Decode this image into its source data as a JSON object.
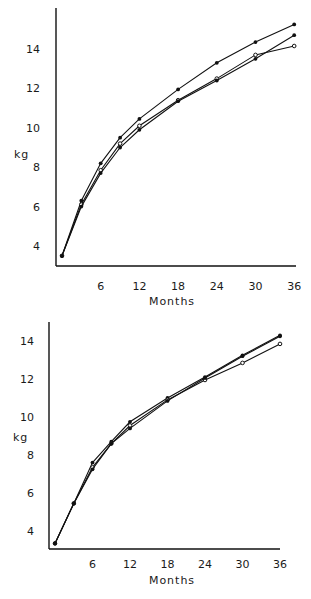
{
  "chart_data": [
    {
      "type": "line",
      "title": "",
      "xlabel": "Months",
      "ylabel": "kg",
      "x": [
        0,
        3,
        6,
        9,
        12,
        18,
        24,
        30,
        36
      ],
      "xticks": [
        6,
        12,
        18,
        24,
        30,
        36
      ],
      "yticks": [
        4,
        6,
        8,
        10,
        12,
        14
      ],
      "xlim": [
        0,
        36
      ],
      "ylim": [
        3,
        15.5
      ],
      "grid": false,
      "legend": null,
      "series": [
        {
          "name": "Series A",
          "marker": "filled",
          "values": [
            3.5,
            6.3,
            8.2,
            9.5,
            10.45,
            11.95,
            13.3,
            14.35,
            15.25
          ]
        },
        {
          "name": "Series B",
          "marker": "open",
          "values": [
            3.5,
            6.1,
            7.85,
            9.2,
            10.1,
            11.4,
            12.5,
            13.7,
            14.15
          ]
        },
        {
          "name": "Series C",
          "marker": "filled",
          "values": [
            3.5,
            6.0,
            7.7,
            9.0,
            9.9,
            11.35,
            12.4,
            13.5,
            14.7
          ]
        }
      ]
    },
    {
      "type": "line",
      "title": "",
      "xlabel": "Months",
      "ylabel": "kg",
      "x": [
        0,
        3,
        6,
        9,
        12,
        18,
        24,
        30,
        36
      ],
      "xticks": [
        6,
        12,
        18,
        24,
        30,
        36
      ],
      "yticks": [
        4,
        6,
        8,
        10,
        12,
        14
      ],
      "xlim": [
        0,
        36
      ],
      "ylim": [
        3,
        15
      ],
      "grid": false,
      "legend": null,
      "series": [
        {
          "name": "Series A",
          "marker": "filled",
          "values": [
            3.35,
            5.45,
            7.6,
            8.7,
            9.75,
            11.0,
            12.1,
            13.25,
            14.3
          ]
        },
        {
          "name": "Series B",
          "marker": "open",
          "values": [
            3.35,
            5.45,
            7.35,
            8.6,
            9.55,
            10.9,
            11.95,
            12.85,
            13.85
          ]
        },
        {
          "name": "Series C",
          "marker": "filled",
          "values": [
            3.35,
            5.45,
            7.25,
            8.6,
            9.4,
            10.85,
            12.05,
            13.2,
            14.25
          ]
        }
      ]
    }
  ],
  "charts": [
    {
      "ylabel": "kg",
      "xlabel": "Months"
    },
    {
      "ylabel": "kg",
      "xlabel": "Months"
    }
  ]
}
